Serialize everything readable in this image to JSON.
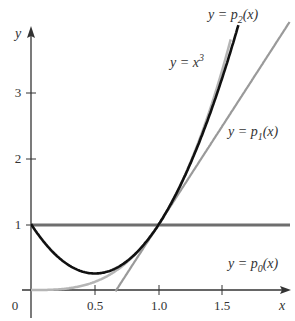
{
  "chart_data": {
    "type": "line",
    "title": "",
    "xlabel": "x",
    "ylabel": "y",
    "xlim": [
      0,
      2.0
    ],
    "ylim": [
      0,
      4.0
    ],
    "x_ticks": [
      "0",
      "0.5",
      "1.0",
      "1.5"
    ],
    "y_ticks": [
      "1",
      "2",
      "3"
    ],
    "grid": false,
    "series": [
      {
        "name": "y = p0(x)",
        "formula": "1",
        "color": "#6e6e6e"
      },
      {
        "name": "y = p1(x)",
        "formula": "3x - 2",
        "color": "#9a9a9a"
      },
      {
        "name": "y = p2(x)",
        "formula": "1 - 3x + 3x^2",
        "color": "#111111"
      },
      {
        "name": "y = x^3",
        "formula": "x^3",
        "color": "#b5b5b5"
      }
    ],
    "labels": {
      "p0": {
        "pre": "y = p",
        "sub": "0",
        "post": "(x)"
      },
      "p1": {
        "pre": "y = p",
        "sub": "1",
        "post": "(x)"
      },
      "p2": {
        "pre": "y = p",
        "sub": "2",
        "post": "(x)"
      },
      "cube": {
        "pre": "y = x",
        "sup": "3"
      }
    }
  }
}
